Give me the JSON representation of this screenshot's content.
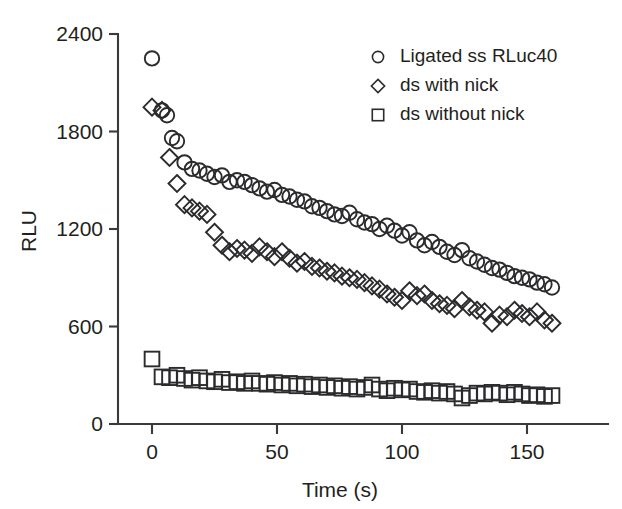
{
  "chart_data": {
    "type": "scatter",
    "title": "",
    "xlabel": "Time (s)",
    "ylabel": "RLU",
    "xlim": [
      -6,
      168
    ],
    "ylim": [
      0,
      2400
    ],
    "xticks": [
      0,
      50,
      100,
      150
    ],
    "xticklabels": [
      "0",
      "50",
      "100",
      "150"
    ],
    "yticks": [
      0,
      600,
      1200,
      1800,
      2400
    ],
    "yticklabels": [
      "0",
      "600",
      "1200",
      "1800",
      "2400"
    ],
    "grid": false,
    "legend_position": "top-right",
    "marker_style": "open",
    "series": [
      {
        "name": "Ligated ss RLuc40",
        "marker": "circle",
        "x": [
          0,
          4,
          6,
          8,
          10,
          13,
          16,
          19,
          22,
          25,
          28,
          31,
          34,
          37,
          40,
          43,
          46,
          49,
          52,
          55,
          58,
          61,
          64,
          67,
          70,
          73,
          76,
          79,
          82,
          85,
          88,
          91,
          94,
          97,
          100,
          103,
          106,
          109,
          112,
          115,
          118,
          121,
          124,
          127,
          130,
          133,
          136,
          139,
          142,
          145,
          148,
          151,
          154,
          157,
          160
        ],
        "y": [
          2250,
          1930,
          1900,
          1760,
          1740,
          1610,
          1570,
          1560,
          1540,
          1520,
          1530,
          1490,
          1500,
          1490,
          1470,
          1450,
          1430,
          1440,
          1410,
          1400,
          1380,
          1370,
          1340,
          1330,
          1310,
          1290,
          1280,
          1300,
          1260,
          1240,
          1230,
          1200,
          1220,
          1190,
          1160,
          1180,
          1130,
          1100,
          1120,
          1090,
          1060,
          1040,
          1070,
          1020,
          1000,
          980,
          960,
          950,
          930,
          910,
          900,
          890,
          870,
          860,
          840
        ]
      },
      {
        "name": "ds with nick",
        "marker": "diamond",
        "x": [
          0,
          4,
          7,
          10,
          13,
          16,
          19,
          22,
          25,
          28,
          31,
          34,
          37,
          40,
          43,
          46,
          49,
          52,
          55,
          58,
          61,
          64,
          67,
          70,
          73,
          76,
          79,
          82,
          85,
          88,
          91,
          94,
          97,
          100,
          103,
          106,
          109,
          112,
          115,
          118,
          121,
          124,
          127,
          130,
          133,
          136,
          139,
          142,
          145,
          148,
          151,
          154,
          157,
          160
        ],
        "y": [
          1950,
          1930,
          1640,
          1480,
          1350,
          1330,
          1310,
          1290,
          1180,
          1100,
          1060,
          1080,
          1070,
          1050,
          1090,
          1060,
          1030,
          1060,
          1020,
          990,
          1000,
          970,
          960,
          940,
          930,
          910,
          900,
          890,
          870,
          850,
          830,
          800,
          780,
          760,
          820,
          790,
          800,
          760,
          740,
          730,
          710,
          760,
          720,
          700,
          690,
          620,
          670,
          660,
          700,
          680,
          660,
          690,
          640,
          620
        ]
      },
      {
        "name": "ds without nick",
        "marker": "square",
        "x": [
          0,
          4,
          7,
          10,
          13,
          16,
          19,
          22,
          25,
          28,
          31,
          34,
          37,
          40,
          43,
          46,
          49,
          52,
          55,
          58,
          61,
          64,
          67,
          70,
          73,
          76,
          79,
          82,
          85,
          88,
          91,
          94,
          97,
          100,
          103,
          106,
          109,
          112,
          115,
          118,
          121,
          124,
          127,
          130,
          133,
          136,
          139,
          142,
          145,
          148,
          151,
          154,
          157,
          160
        ],
        "y": [
          400,
          290,
          285,
          300,
          280,
          270,
          285,
          265,
          260,
          275,
          255,
          260,
          250,
          265,
          250,
          245,
          255,
          240,
          250,
          235,
          245,
          230,
          240,
          225,
          235,
          220,
          230,
          215,
          225,
          240,
          215,
          205,
          220,
          210,
          215,
          200,
          195,
          205,
          190,
          200,
          185,
          160,
          175,
          190,
          185,
          195,
          190,
          180,
          195,
          185,
          175,
          180,
          170,
          175
        ]
      }
    ]
  },
  "axes": {
    "ylabel": "RLU",
    "xlabel": "Time (s)"
  },
  "legend": {
    "entries": [
      {
        "label": "Ligated ss RLuc40",
        "marker": "circle"
      },
      {
        "label": "ds with nick",
        "marker": "diamond"
      },
      {
        "label": "ds without nick",
        "marker": "square"
      }
    ]
  },
  "colors": {
    "marker_stroke": "#2b2b2d",
    "axis": "#3a3a3c",
    "text": "#231f20",
    "background": "#ffffff"
  }
}
